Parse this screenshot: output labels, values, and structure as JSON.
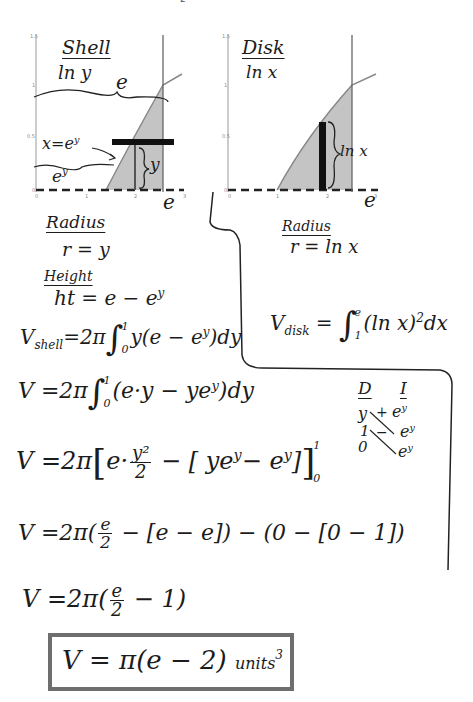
{
  "page_marker": "2",
  "shell_graph": {
    "title": "Shell",
    "subtitle": "ln y",
    "label_top_brace": "e",
    "label_curve": "x=e^y",
    "label_left": "e^y",
    "label_bracket": "y",
    "label_x_end": "e",
    "x_ticks": [
      "0",
      "1",
      "2",
      "3"
    ],
    "y_ticks": [
      "0",
      "0.5",
      "1",
      "1.5"
    ],
    "y_axis_label": "y",
    "x_axis_label": "x"
  },
  "disk_graph": {
    "title": "Disk",
    "subtitle": "ln x",
    "label_bracket": "ln x",
    "label_x_end": "e",
    "x_ticks": [
      "0",
      "1",
      "2",
      "3"
    ],
    "y_ticks": [
      "0",
      "0.5",
      "1",
      "1.5"
    ],
    "y_axis_label": "y",
    "x_axis_label": "x"
  },
  "shell_setup": {
    "radius_heading": "Radius",
    "radius_eq": "r = y",
    "height_heading": "Height",
    "height_lhs": "ht = e − e",
    "height_exp": "y"
  },
  "disk_setup": {
    "radius_heading": "Radius",
    "radius_eq": "r = ln x",
    "vdisk_lhs": "V",
    "vdisk_sub": "disk",
    "vdisk_eq": "=",
    "vdisk_upper": "e",
    "vdisk_lower": "1",
    "vdisk_integrand": "(ln x)",
    "vdisk_power": "2",
    "vdisk_dx": "dx"
  },
  "work": {
    "line1": {
      "lhs": "V",
      "sub": "shell",
      "pre": "=2π",
      "upper": "1",
      "lower": "0",
      "body": "y(e − e",
      "exp": "y",
      "tail": ")dy"
    },
    "line2": {
      "lhs": "V",
      "pre": "=2π",
      "upper": "1",
      "lower": "0",
      "body": "(e·y − ye",
      "exp": "y",
      "tail": ")dy"
    },
    "line3": {
      "lhs": "V",
      "pre": "=2π",
      "a": "e·",
      "frac_num": "y²",
      "frac_den": "2",
      "b": "− [ ye",
      "exp1": "y",
      "c": "− e",
      "exp2": "y",
      "d": "]",
      "upper": "1",
      "lower": "0"
    },
    "line4": {
      "lhs": "V",
      "pre": "=2π(",
      "frac_num": "e",
      "frac_den": "2",
      "b": "− [e − e]) − (0 − [0 − 1])"
    },
    "line5": {
      "lhs": "V",
      "pre": "=2π(",
      "frac_num": "e",
      "frac_den": "2",
      "b": "− 1)"
    },
    "answer": {
      "text": "V = π(e − 2)",
      "units": "units",
      "units_exp": "3"
    }
  },
  "tabular": {
    "col_d": "D",
    "col_i": "I",
    "d_rows": [
      "y",
      "1",
      "0"
    ],
    "i_rows": [
      "e^y",
      "e^y",
      "e^y"
    ],
    "signs": [
      "+",
      "−"
    ]
  }
}
